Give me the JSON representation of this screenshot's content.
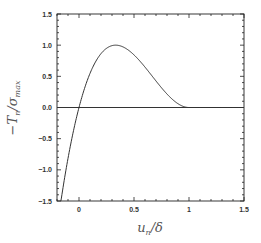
{
  "chart_data": {
    "type": "line",
    "title": "",
    "xlabel": "u_n/δ",
    "ylabel": "−T_n/σ_max",
    "xlim": [
      -0.2,
      1.5
    ],
    "ylim": [
      -1.5,
      1.5
    ],
    "grid": false,
    "legend": null,
    "x_ticks": [
      "0",
      "0.5",
      "1",
      "1.5"
    ],
    "x_tick_values": [
      0,
      0.5,
      1,
      1.5
    ],
    "y_ticks": [
      "-1.5",
      "-1.0",
      "-0.5",
      "0.0",
      "0.5",
      "1.0",
      "1.5"
    ],
    "y_tick_values": [
      -1.5,
      -1.0,
      -0.5,
      0.0,
      0.5,
      1.0,
      1.5
    ],
    "series": [
      {
        "name": "traction-separation",
        "description": "Cubic cohesive law -T/σmax = 27/4 · u · (1-u)^2 for u ≤ 1, 0 for u > 1",
        "x": [
          -0.165,
          -0.1,
          0.0,
          0.1,
          0.2,
          0.3,
          0.333,
          0.4,
          0.5,
          0.6,
          0.7,
          0.8,
          0.9,
          1.0,
          1.5
        ],
        "y": [
          -1.5,
          -0.82,
          0.0,
          0.547,
          0.864,
          0.992,
          1.0,
          0.972,
          0.844,
          0.648,
          0.425,
          0.216,
          0.061,
          0.0,
          0.0
        ]
      },
      {
        "name": "zero-line",
        "x": [
          -0.2,
          1.5
        ],
        "y": [
          0.0,
          0.0
        ]
      }
    ]
  }
}
